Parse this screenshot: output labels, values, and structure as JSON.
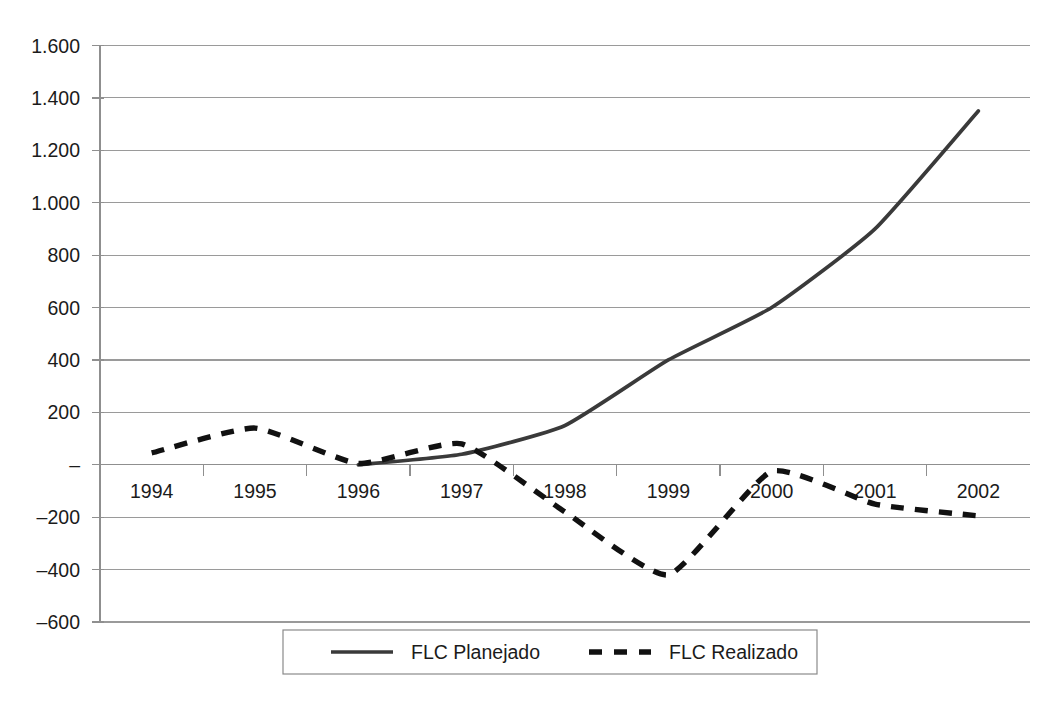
{
  "chart_data": {
    "type": "line",
    "title": "",
    "subtitle": "",
    "xlabel": "",
    "ylabel": "",
    "categories": [
      "1994",
      "1995",
      "1996",
      "1997",
      "1998",
      "1999",
      "2000",
      "2001",
      "2002"
    ],
    "ylim": [
      -600,
      1600
    ],
    "ytick_values": [
      1600,
      1400,
      1200,
      1000,
      800,
      600,
      400,
      200,
      0,
      -200,
      -400,
      -600
    ],
    "ytick_labels": [
      "1.600",
      "1.400",
      "1.200",
      "1.000",
      "800",
      "600",
      "400",
      "200",
      "–",
      "–200",
      "–400",
      "–600"
    ],
    "grid": true,
    "grid_axis": "y",
    "legend_position": "bottom",
    "series": [
      {
        "name": "FLC Planejado",
        "style": "solid",
        "color": "#3a3a3a",
        "x": [
          "1996",
          "1997",
          "1998",
          "1999",
          "2000",
          "2001",
          "2002"
        ],
        "values": [
          0,
          40,
          150,
          400,
          600,
          900,
          1350
        ]
      },
      {
        "name": "FLC Realizado",
        "style": "dashed",
        "color": "#111111",
        "x": [
          "1994",
          "1995",
          "1996",
          "1997",
          "1998",
          "1999",
          "2000",
          "2001",
          "2002"
        ],
        "values": [
          45,
          140,
          5,
          80,
          -180,
          -420,
          -25,
          -150,
          -195
        ]
      }
    ]
  },
  "legend": {
    "entries": [
      {
        "label": "FLC Planejado",
        "swatch": "solid-line-swatch"
      },
      {
        "label": "FLC Realizado",
        "swatch": "dashed-line-swatch"
      }
    ]
  },
  "axes": {
    "y_labels": [
      "1.600",
      "1.400",
      "1.200",
      "1.000",
      "800",
      "600",
      "400",
      "200",
      "–",
      "–200",
      "–400",
      "–600"
    ],
    "x_labels": [
      "1994",
      "1995",
      "1996",
      "1997",
      "1998",
      "1999",
      "2000",
      "2001",
      "2002"
    ]
  },
  "colors": {
    "planejado": "#3a3a3a",
    "realizado": "#111111",
    "gridline": "#9a9a9a",
    "axis": "#8f8f8f",
    "text": "#1b1b1b",
    "background": "#ffffff"
  }
}
